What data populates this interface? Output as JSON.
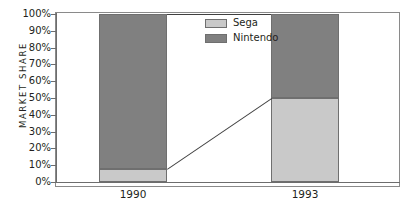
{
  "chart_data": {
    "type": "bar",
    "subtype": "100% stacked column",
    "title": "",
    "xlabel": "",
    "ylabel": "MARKET SHARE",
    "categories": [
      "1990",
      "1993"
    ],
    "series": [
      {
        "name": "Sega",
        "values": [
          8,
          50
        ],
        "color": "#c9c9c9"
      },
      {
        "name": "Nintendo",
        "values": [
          92,
          50
        ],
        "color": "#808080"
      }
    ],
    "ylim": [
      0,
      100
    ],
    "ytick_labels": [
      "100%",
      "90%",
      "80%",
      "70%",
      "60%",
      "50%",
      "40%",
      "30%",
      "20%",
      "10%",
      "0%"
    ],
    "ytick_values": [
      100,
      90,
      80,
      70,
      60,
      50,
      40,
      30,
      20,
      10,
      0
    ],
    "grid": false,
    "legend_position": "inside-top-center",
    "connectors": true
  },
  "legend": {
    "items": [
      {
        "label": "Sega",
        "color": "#c9c9c9"
      },
      {
        "label": "Nintendo",
        "color": "#808080"
      }
    ]
  },
  "axis": {
    "y_title": "MARKET SHARE"
  },
  "colors": {
    "sega": "#c9c9c9",
    "nintendo": "#808080",
    "frame": "#8a8a8a",
    "axis": "#6d6d6d",
    "text": "#231f20"
  }
}
